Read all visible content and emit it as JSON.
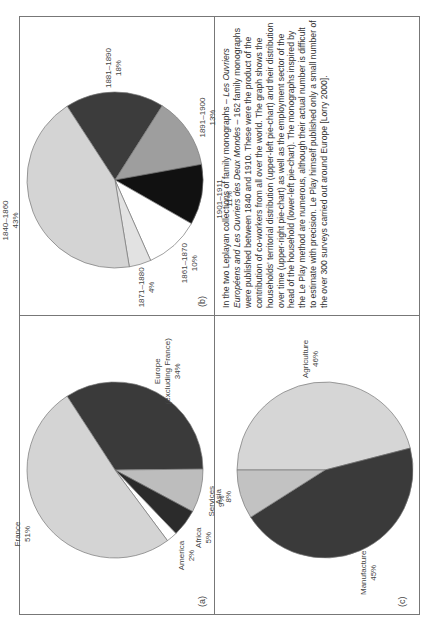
{
  "figure": {
    "caption_parts": [
      {
        "text": "In the two Leplayan collections of family monographs – ",
        "italic": false
      },
      {
        "text": "Les Ouvriers Européens and Les Ouvriers des Deux Mondes",
        "italic": true
      },
      {
        "text": " – 162 family monographs were published between 1840 and 1910. These were the product of the contribution of co-workers from all over the world. The graph shows the households’ territorial distribution (upper-left pie-chart) and their distribution over time (upper-right pie-chart) as well as the employment sector of the head of the household (lower-left pie-chart). The monographs inspired by the Le Play method are numerous, although their actual number is difficult to estimate with precision. Le Play himself published only a small number of the over 300 surveys carried out around Europe [Lorry 2000].",
        "italic": false
      }
    ]
  },
  "chart_data": [
    {
      "type": "pie",
      "panel": "(a)",
      "title": "Territorial distribution",
      "slices": [
        {
          "label": "France",
          "value": 51,
          "display": "51%",
          "color": "#d4d4d4"
        },
        {
          "label": "Europe (excluding France)",
          "label_lines": [
            "Europe",
            "(excluding France)"
          ],
          "value": 34,
          "display": "34%",
          "color": "#3a3a3a"
        },
        {
          "label": "Asia",
          "value": 8,
          "display": "8%",
          "color": "#bdbdbd"
        },
        {
          "label": "Africa",
          "value": 5,
          "display": "5%",
          "color": "#2b2b2b"
        },
        {
          "label": "America",
          "value": 2,
          "display": "2%",
          "color": "#ffffff"
        }
      ]
    },
    {
      "type": "pie",
      "panel": "(b)",
      "title": "Distribution over time",
      "slices": [
        {
          "label": "1840–1860",
          "value": 43,
          "display": "43%",
          "color": "#d4d4d4"
        },
        {
          "label": "1881–1890",
          "value": 18,
          "display": "18%",
          "color": "#3c3c3c"
        },
        {
          "label": "1891–1900",
          "value": 13,
          "display": "13%",
          "color": "#9e9e9e"
        },
        {
          "label": "1901–1911",
          "value": 11,
          "display": "11%",
          "color": "#111111"
        },
        {
          "label": "1861–1870",
          "value": 10,
          "display": "10%",
          "color": "#ffffff"
        },
        {
          "label": "1871–1880",
          "value": 4,
          "display": "4%",
          "color": "#e2e2e2"
        }
      ]
    },
    {
      "type": "pie",
      "panel": "(c)",
      "title": "Employment sector of head of household",
      "slices": [
        {
          "label": "Agriculture",
          "value": 46,
          "display": "46%",
          "color": "#d6d6d6"
        },
        {
          "label": "Manufacture",
          "value": 45,
          "display": "45%",
          "color": "#3a3a3a"
        },
        {
          "label": "Services",
          "value": 9,
          "display": "9%",
          "color": "#c2c2c2"
        }
      ]
    }
  ]
}
